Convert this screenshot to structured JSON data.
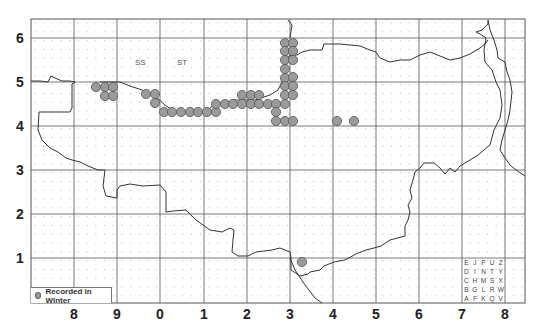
{
  "map": {
    "type": "distribution-map",
    "grid_squares": [
      "SS",
      "ST"
    ],
    "x_axis_labels": [
      "8",
      "9",
      "0",
      "1",
      "2",
      "3",
      "4",
      "5",
      "6",
      "7",
      "8"
    ],
    "y_axis_labels": [
      "6",
      "5",
      "4",
      "3",
      "2",
      "1"
    ],
    "colors": {
      "record_fill": "#9a9a9a",
      "record_stroke": "#555555",
      "grid": "#555555",
      "coast": "#333333",
      "dot": "#bbbbbb"
    }
  },
  "legend": {
    "label": "Recorded in Winter"
  },
  "tetrad_key": {
    "rows": [
      [
        "E",
        "J",
        "P",
        "U",
        "Z"
      ],
      [
        "D",
        "I",
        "N",
        "T",
        "Y"
      ],
      [
        "C",
        "H",
        "M",
        "S",
        "X"
      ],
      [
        "B",
        "G",
        "L",
        "R",
        "W"
      ],
      [
        "A",
        "F",
        "K",
        "Q",
        "V"
      ]
    ]
  },
  "records": [
    [
      96,
      87
    ],
    [
      105,
      87
    ],
    [
      113,
      87
    ],
    [
      105,
      96
    ],
    [
      113,
      96
    ],
    [
      146,
      94
    ],
    [
      155,
      94
    ],
    [
      155,
      103
    ],
    [
      164,
      112
    ],
    [
      172,
      112
    ],
    [
      181,
      112
    ],
    [
      190,
      112
    ],
    [
      198,
      112
    ],
    [
      207,
      112
    ],
    [
      216,
      112
    ],
    [
      216,
      104
    ],
    [
      225,
      104
    ],
    [
      233,
      104
    ],
    [
      242,
      104
    ],
    [
      251,
      104
    ],
    [
      259,
      104
    ],
    [
      268,
      104
    ],
    [
      242,
      95
    ],
    [
      251,
      95
    ],
    [
      259,
      95
    ],
    [
      285,
      43
    ],
    [
      285,
      51
    ],
    [
      285,
      60
    ],
    [
      285,
      69
    ],
    [
      285,
      78
    ],
    [
      285,
      86
    ],
    [
      285,
      95
    ],
    [
      285,
      104
    ],
    [
      293,
      43
    ],
    [
      293,
      51
    ],
    [
      293,
      60
    ],
    [
      293,
      77
    ],
    [
      293,
      86
    ],
    [
      293,
      95
    ],
    [
      276,
      104
    ],
    [
      276,
      112
    ],
    [
      276,
      121
    ],
    [
      285,
      121
    ],
    [
      293,
      121
    ],
    [
      337,
      121
    ],
    [
      354,
      121
    ],
    [
      302,
      262
    ]
  ]
}
